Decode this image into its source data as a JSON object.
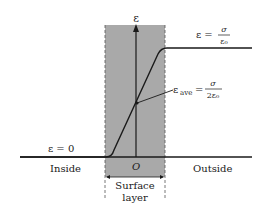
{
  "figure": {
    "axis_label": "ε",
    "origin_label": "O",
    "top_label": {
      "lhs": "ε =",
      "numerator": "σ",
      "denominator": "ε₀"
    },
    "average_label": {
      "lhs": "ε",
      "subscript": "ave",
      "eq": "=",
      "numerator": "σ",
      "denominator": "2ε₀"
    },
    "zero_label": "ε = 0",
    "inside_label": "Inside",
    "outside_label": "Outside",
    "surface_label_line1": "Surface",
    "surface_label_line2": "layer",
    "colors": {
      "shade": "#a9a9a9",
      "line": "#1a1a1a",
      "background": "#ffffff"
    }
  }
}
